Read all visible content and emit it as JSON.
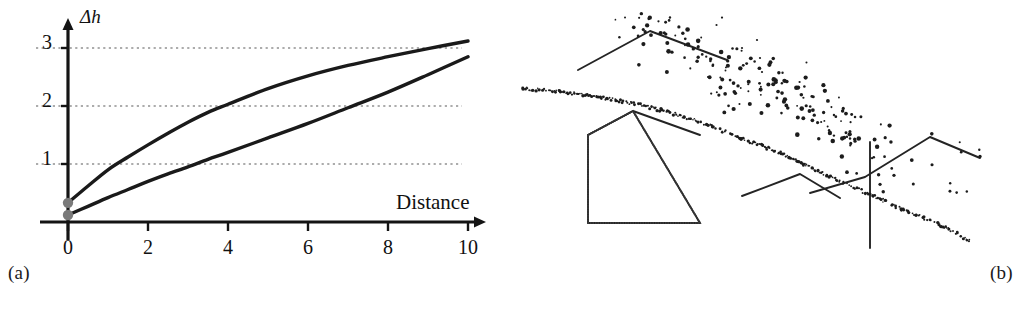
{
  "figure": {
    "panels": [
      {
        "id": "a",
        "caption": "(a)",
        "kind": "line-chart"
      },
      {
        "id": "b",
        "caption": "(b)",
        "kind": "point-cloud-profile"
      }
    ]
  },
  "chart_data": [
    {
      "type": "line",
      "panel": "a",
      "title": "",
      "xlabel": "Distance",
      "ylabel": "Δh",
      "xlim": [
        0,
        10.6
      ],
      "ylim": [
        0,
        3.35
      ],
      "xticks": [
        "0",
        "2",
        "4",
        "6",
        "8",
        "10"
      ],
      "xtick_values": [
        0,
        2,
        4,
        6,
        8,
        10
      ],
      "yticks": [
        "1",
        "2",
        "3"
      ],
      "ytick_values": [
        1,
        2,
        3
      ],
      "grid": "horizontal-dotted",
      "legend": "none",
      "markers": [
        {
          "name": "start-point-upper",
          "x": 0,
          "y": 0.33,
          "color": "#7a7a7a"
        },
        {
          "name": "start-point-lower",
          "x": 0,
          "y": 0.12,
          "color": "#7a7a7a"
        }
      ],
      "series": [
        {
          "name": "upper-curve",
          "color": "#1a1a1a",
          "x": [
            0,
            0.5,
            1,
            1.5,
            2,
            2.5,
            3,
            3.5,
            4,
            5,
            6,
            7,
            8,
            9,
            10
          ],
          "values": [
            0.33,
            0.62,
            0.9,
            1.12,
            1.33,
            1.53,
            1.72,
            1.89,
            2.03,
            2.3,
            2.52,
            2.7,
            2.85,
            2.99,
            3.12
          ]
        },
        {
          "name": "lower-curve",
          "color": "#1a1a1a",
          "x": [
            0,
            0.5,
            1,
            1.5,
            2,
            2.5,
            3,
            3.5,
            4,
            5,
            6,
            7,
            8,
            9,
            10
          ],
          "values": [
            0.12,
            0.27,
            0.42,
            0.56,
            0.7,
            0.83,
            0.95,
            1.08,
            1.2,
            1.45,
            1.7,
            1.97,
            2.24,
            2.54,
            2.85
          ]
        }
      ]
    },
    {
      "type": "scatter",
      "panel": "b",
      "title": "",
      "xlabel": "",
      "ylabel": "",
      "description": "Cross-section of a laser-scan point cloud over buildings, ground and vegetation",
      "elements": [
        {
          "name": "left-roof-outline",
          "kind": "polyline",
          "points": [
            [
              68,
              70
            ],
            [
              140,
              31
            ],
            [
              217,
              60
            ]
          ]
        },
        {
          "name": "house-outline",
          "kind": "polyline",
          "points": [
            [
              78,
              135
            ],
            [
              123,
              111
            ],
            [
              190,
              223
            ],
            [
              78,
              223
            ],
            [
              78,
              135
            ]
          ]
        },
        {
          "name": "house-roof-outline",
          "kind": "polyline",
          "points": [
            [
              78,
              135
            ],
            [
              123,
              111
            ],
            [
              190,
              135
            ]
          ]
        },
        {
          "name": "right-roof-outline-low",
          "kind": "polyline",
          "points": [
            [
              232,
              196
            ],
            [
              290,
              174
            ],
            [
              330,
              198
            ]
          ]
        },
        {
          "name": "right-roof-outline-high",
          "kind": "polyline",
          "points": [
            [
              300,
              193
            ],
            [
              355,
              177
            ],
            [
              420,
              137
            ],
            [
              470,
              158
            ]
          ]
        },
        {
          "name": "vertical-wall-line",
          "kind": "polyline",
          "points": [
            [
              360,
              142
            ],
            [
              360,
              248
            ]
          ]
        },
        {
          "name": "terrain-point-line",
          "kind": "dotted-profile",
          "points": [
            [
              12,
              88
            ],
            [
              60,
              93
            ],
            [
              110,
              101
            ],
            [
              150,
              110
            ],
            [
              190,
              122
            ],
            [
              230,
              138
            ],
            [
              270,
              153
            ],
            [
              310,
              172
            ],
            [
              350,
              190
            ],
            [
              390,
              208
            ],
            [
              430,
              225
            ],
            [
              460,
              241
            ]
          ]
        },
        {
          "name": "vegetation-point-cluster",
          "kind": "scatter-blob"
        }
      ]
    }
  ]
}
